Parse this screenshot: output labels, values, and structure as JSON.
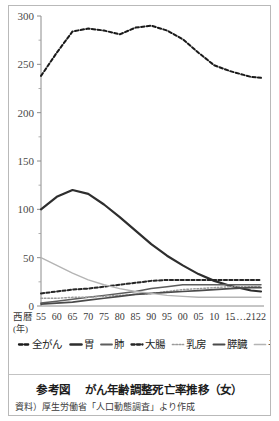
{
  "figure": {
    "caption_label": "参考図",
    "caption_title": "がん年齢調整死亡率推移（女）",
    "source_note": "資料）厚生労働省「人口動態調査」より作成"
  },
  "axis": {
    "x_prefix_label": "西暦",
    "x_unit_label": "(年)",
    "x_gap_marker": "……",
    "y_ticks": [
      "0",
      "50",
      "100",
      "150",
      "200",
      "250",
      "300"
    ],
    "x_ticks": [
      "55",
      "60",
      "65",
      "70",
      "75",
      "80",
      "80",
      "85",
      "90",
      "95",
      "00",
      "05",
      "10",
      "15",
      "21",
      "22"
    ]
  },
  "legend": {
    "items": [
      {
        "label": "全がん",
        "style": "dashed-bold",
        "color": "#1a1a1a"
      },
      {
        "label": "胃",
        "style": "solid-bold",
        "color": "#2e2e2e"
      },
      {
        "label": "肺",
        "style": "solid",
        "color": "#5d5d5d"
      },
      {
        "label": "大腸",
        "style": "dashed",
        "color": "#262626"
      },
      {
        "label": "乳房",
        "style": "dotted",
        "color": "#9a9a9a"
      },
      {
        "label": "膵臓",
        "style": "solid-bold2",
        "color": "#4a4a4a"
      },
      {
        "label": "子宮",
        "style": "solid-thin",
        "color": "#b4b4b4"
      }
    ]
  },
  "chart_data": {
    "type": "line",
    "title": "がん年齢調整死亡率推移（女）",
    "xlabel": "西暦 (年)",
    "ylabel": "",
    "ylim": [
      0,
      300
    ],
    "yticks": [
      0,
      50,
      100,
      150,
      200,
      250,
      300
    ],
    "minor_tick_step": 25,
    "grid": false,
    "legend_position": "below",
    "x": [
      1955,
      1960,
      1965,
      1970,
      1975,
      1980,
      1985,
      1990,
      1995,
      2000,
      2005,
      2010,
      2015,
      2021,
      2022
    ],
    "x_tick_labels": [
      "55",
      "60",
      "65",
      "70",
      "75",
      "80",
      "85",
      "90",
      "95",
      "00",
      "05",
      "10",
      "15",
      "21",
      "22"
    ],
    "series": [
      {
        "name": "全がん",
        "style": "dashed-bold",
        "color": "#1a1a1a",
        "values": [
          238,
          262,
          284,
          287,
          285,
          281,
          288,
          290,
          285,
          276,
          262,
          249,
          243,
          237,
          236
        ]
      },
      {
        "name": "胃",
        "style": "solid-bold",
        "color": "#2e2e2e",
        "values": [
          100,
          113,
          120,
          116,
          105,
          92,
          78,
          64,
          52,
          42,
          33,
          26,
          21,
          16,
          15
        ]
      },
      {
        "name": "肺",
        "style": "solid",
        "color": "#5d5d5d",
        "values": [
          3,
          5,
          7,
          9,
          11,
          13,
          15,
          18,
          20,
          22,
          22,
          22,
          22,
          22,
          22
        ]
      },
      {
        "name": "大腸",
        "style": "dashed",
        "color": "#262626",
        "values": [
          13,
          15,
          17,
          18,
          20,
          22,
          24,
          26,
          27,
          27,
          27,
          27,
          27,
          27,
          27
        ]
      },
      {
        "name": "乳房",
        "style": "dotted",
        "color": "#9a9a9a",
        "values": [
          8,
          8,
          9,
          9,
          10,
          11,
          12,
          13,
          15,
          17,
          18,
          19,
          20,
          20,
          20
        ]
      },
      {
        "name": "膵臓",
        "style": "solid-bold2",
        "color": "#4a4a4a",
        "values": [
          2,
          3,
          4,
          6,
          8,
          10,
          12,
          13,
          14,
          15,
          16,
          17,
          18,
          19,
          19
        ]
      },
      {
        "name": "子宮",
        "style": "solid-thin",
        "color": "#b4b4b4",
        "values": [
          50,
          42,
          34,
          27,
          22,
          18,
          15,
          13,
          11,
          10,
          9,
          9,
          9,
          9,
          9
        ]
      }
    ]
  }
}
